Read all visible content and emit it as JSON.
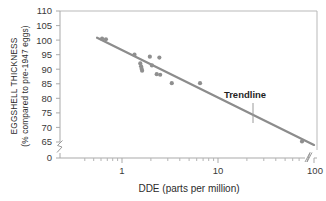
{
  "chart_data": {
    "type": "scatter",
    "title": "",
    "xlabel": "DDE (parts per million)",
    "ylabel_line1": "EGGSHELL THICKNESS",
    "ylabel_line2": "(% compared to pre-1947 eggs)",
    "xscale": "log",
    "xlim": [
      0.35,
      100
    ],
    "ylim": [
      60,
      110
    ],
    "grid": false,
    "legend": "none",
    "y_ticks": [
      110,
      105,
      100,
      95,
      90,
      85,
      80,
      75,
      70,
      65
    ],
    "y_axis_break_value": "0",
    "y_tick_labels": [
      "110",
      "105",
      "100",
      "95",
      "90",
      "85",
      "80",
      "75",
      "70",
      "65",
      "0"
    ],
    "x_ticks": [
      1,
      10,
      100
    ],
    "x_tick_labels": [
      "1",
      "10",
      "100"
    ],
    "x_minor_ticks": [
      0.4,
      0.5,
      0.6,
      0.7,
      0.8,
      0.9,
      2,
      3,
      4,
      5,
      6,
      7,
      8,
      9,
      20,
      30,
      40,
      50,
      60,
      70,
      80,
      90
    ],
    "series": [
      {
        "name": "Eggshell thickness vs DDE",
        "marker": "circle",
        "color": "#8f8f8f",
        "points": [
          {
            "x": 0.62,
            "y": 100.5
          },
          {
            "x": 0.68,
            "y": 100.3
          },
          {
            "x": 1.35,
            "y": 95.0
          },
          {
            "x": 1.55,
            "y": 92.0
          },
          {
            "x": 1.58,
            "y": 91.0
          },
          {
            "x": 1.6,
            "y": 90.2
          },
          {
            "x": 1.62,
            "y": 89.5
          },
          {
            "x": 1.95,
            "y": 94.3
          },
          {
            "x": 2.05,
            "y": 91.3
          },
          {
            "x": 2.3,
            "y": 88.3
          },
          {
            "x": 2.45,
            "y": 94.0
          },
          {
            "x": 2.5,
            "y": 88.1
          },
          {
            "x": 3.3,
            "y": 85.2
          },
          {
            "x": 6.5,
            "y": 85.2
          },
          {
            "x": 75.0,
            "y": 65.2
          }
        ]
      }
    ],
    "trendline": {
      "label": "Trendline",
      "color": "#8c8c8c",
      "x_start": 0.55,
      "y_start": 100.8,
      "x_end": 100.0,
      "y_end": 64.0
    },
    "annotations": [
      {
        "text": "Trendline",
        "x_frac": 0.775,
        "y_value": 80.5,
        "leader": true
      }
    ]
  }
}
